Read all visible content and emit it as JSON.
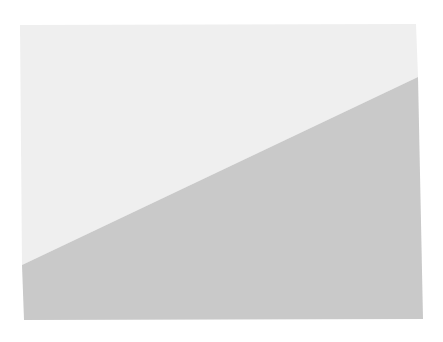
{
  "diagram": {
    "background": "#ffffff",
    "rectangle": {
      "points": [
        [
          20,
          25
        ],
        [
          416,
          24
        ],
        [
          423,
          319
        ],
        [
          24,
          320
        ]
      ]
    },
    "upper_region": {
      "color": "#efefef",
      "points": [
        [
          20,
          25
        ],
        [
          416,
          24
        ],
        [
          418,
          77
        ],
        [
          22,
          265
        ]
      ]
    },
    "lower_region": {
      "color": "#c9c9c9",
      "points": [
        [
          22,
          265
        ],
        [
          418,
          77
        ],
        [
          423,
          319
        ],
        [
          24,
          320
        ]
      ]
    },
    "divider_line": {
      "from": [
        22,
        265
      ],
      "to": [
        418,
        77
      ]
    }
  }
}
